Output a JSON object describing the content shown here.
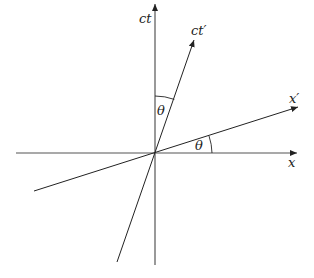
{
  "diagram": {
    "title": "",
    "type": "spacetime-diagram",
    "origin": {
      "x": 155,
      "y": 153
    },
    "axes": {
      "x": {
        "label": "x",
        "from": {
          "x": 16,
          "y": 153
        },
        "to": {
          "x": 297,
          "y": 153
        }
      },
      "ct": {
        "label": "ct",
        "from": {
          "x": 155,
          "y": 265
        },
        "to": {
          "x": 155,
          "y": 4
        }
      },
      "x_prime": {
        "label": "x′",
        "from": {
          "x": 34,
          "y": 191
        },
        "to": {
          "x": 298,
          "y": 107
        }
      },
      "ct_prime": {
        "label": "ct′",
        "from": {
          "x": 117,
          "y": 262
        },
        "to": {
          "x": 194,
          "y": 40
        }
      }
    },
    "angles": [
      {
        "name": "theta-between-ct-and-ctprime",
        "label": "θ"
      },
      {
        "name": "theta-between-x-and-xprime",
        "label": "θ"
      }
    ],
    "colors": {
      "line": "#222222",
      "background": "#ffffff"
    }
  }
}
